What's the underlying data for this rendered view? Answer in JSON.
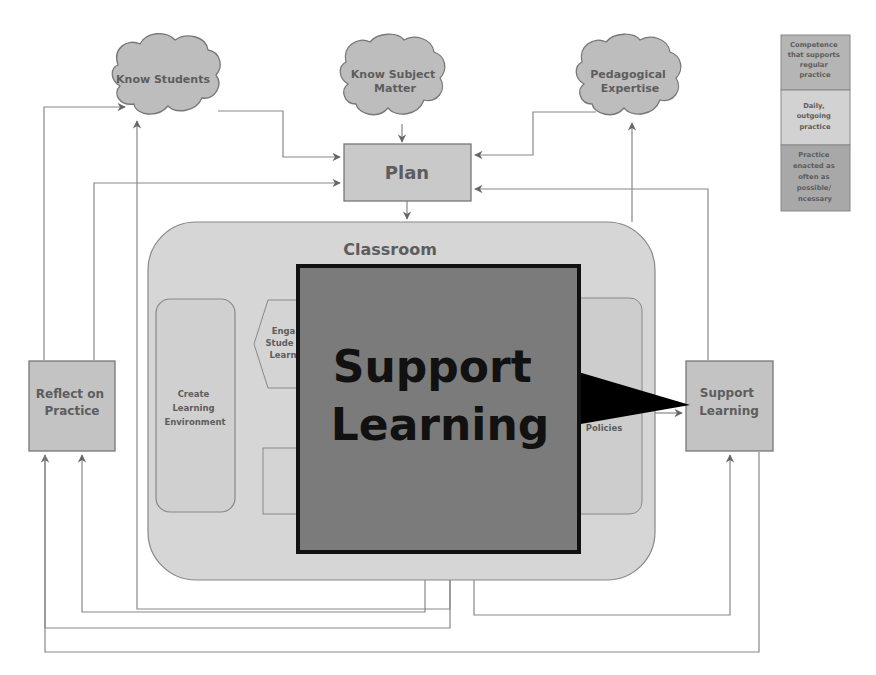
{
  "clouds": {
    "know_students": [
      "Know Students"
    ],
    "know_subject_matter": [
      "Know Subject",
      "Matter"
    ],
    "pedagogical_expertise": [
      "Pedagogical",
      "Expertise"
    ]
  },
  "plan": {
    "label": "Plan"
  },
  "classroom": {
    "title": "Classroom",
    "create_learning_environment": [
      "Create",
      "Learning",
      "Environment"
    ],
    "engage_students_partial": [
      "Enga",
      "Stude",
      "Learn"
    ],
    "policies_partial": "Policies"
  },
  "reflect_on_practice": [
    "Reflect on",
    "Practice"
  ],
  "support_learning_box": [
    "Support",
    "Learning"
  ],
  "overlay": {
    "label": [
      "Support",
      "Learning"
    ],
    "colors": {
      "fill": "#7b7b7b",
      "border": "#111111",
      "pointer": "#000000"
    }
  },
  "legend": {
    "items": [
      {
        "label": [
          "Competence",
          "that supports",
          "regular",
          "practice"
        ],
        "color": "#b5b5b5"
      },
      {
        "label": [
          "Daily,",
          "outgoing",
          "practice"
        ],
        "color": "#d2d2d2"
      },
      {
        "label": [
          "Practice",
          "enacted as",
          "often as",
          "possible/",
          "ncessary"
        ],
        "color": "#a8a8a8"
      }
    ]
  },
  "colors": {
    "cloud": "#bdbdbd",
    "box": "#c9c9c9",
    "classroom": "#d6d6d6",
    "inner": "#cfcfcf",
    "line": "#777777",
    "text": "#5d5d5d"
  }
}
